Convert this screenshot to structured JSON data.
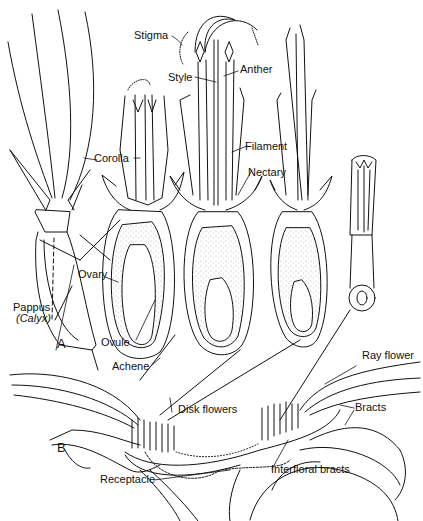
{
  "figure": {
    "panels": [
      {
        "id": "A",
        "label": "A"
      },
      {
        "id": "B",
        "label": "B"
      }
    ],
    "labels": {
      "stigma": "Stigma",
      "style": "Style",
      "anther": "Anther",
      "corolla": "Corolla",
      "filament": "Filament",
      "nectary": "Nectary",
      "ovary": "Ovary",
      "pappus": "Pappus",
      "calyx": "(Calyx)",
      "ovule": "Ovule",
      "achene": "Achene",
      "ray_flower": "Ray flower",
      "disk_flowers": "Disk flowers",
      "bracts": "Bracts",
      "receptacle": "Receptacle",
      "interfloral_bracts": "Interfloral bracts"
    },
    "colors": {
      "ink": "#111111",
      "background": "#ffffff",
      "stipple": "#9a9a9a"
    }
  }
}
